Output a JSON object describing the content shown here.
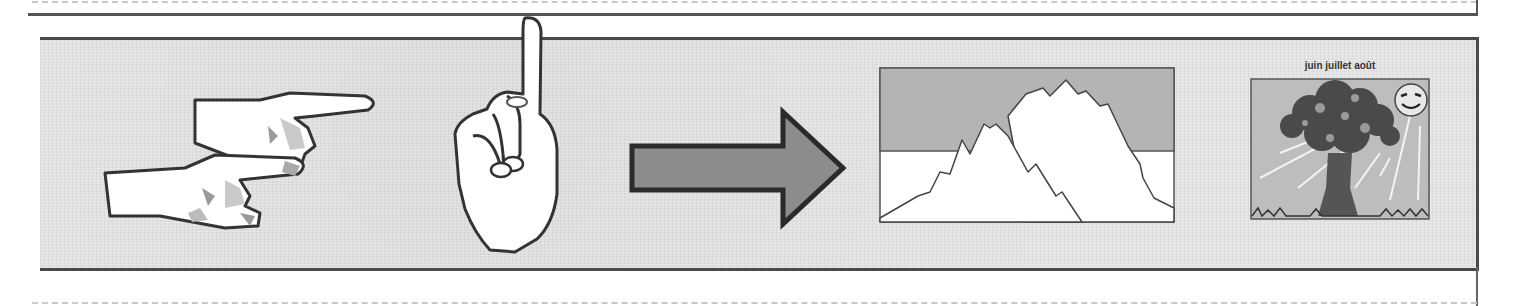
{
  "page": {
    "type": "worksheet-strip",
    "background": "#ffffff",
    "panel_color": "#e3e3e3",
    "border_color": "#4a4a4a"
  },
  "illustrations": [
    {
      "id": "two-pointing-hands",
      "icon": "pointing-hands-icon",
      "description": "two hands pointing right"
    },
    {
      "id": "index-finger-up",
      "icon": "raised-index-finger-icon",
      "description": "hand with index finger raised"
    },
    {
      "id": "arrow",
      "icon": "right-arrow-icon",
      "description": "thick arrow pointing right"
    },
    {
      "id": "histogram-mountains",
      "icon": "mountain-histogram-icon",
      "description": "two overlapping mountain-shaped curves in a box"
    },
    {
      "id": "summer-tree",
      "icon": "tree-sun-icon",
      "description": "tree with smiling sun and rays",
      "caption": "juin juillet août"
    }
  ],
  "summer_tree": {
    "caption": "juin juillet août"
  }
}
